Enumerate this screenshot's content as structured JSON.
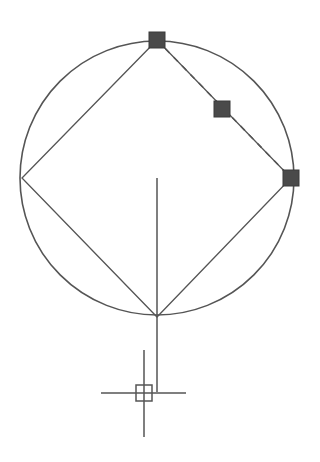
{
  "canvas": {
    "width": 320,
    "height": 462,
    "background": "#ffffff",
    "stroke_color": "#555555",
    "grip_color": "#4a4a4a"
  },
  "circle": {
    "cx": 157,
    "cy": 178,
    "r": 137
  },
  "inscribed_square": {
    "points": [
      [
        157,
        40
      ],
      [
        291,
        178
      ],
      [
        157,
        317
      ],
      [
        22,
        178
      ]
    ]
  },
  "rubber_band_line": {
    "x1": 157,
    "y1": 40,
    "x2": 291,
    "y2": 178,
    "style": "dashed"
  },
  "grips": [
    {
      "name": "grip-top",
      "x": 157,
      "y": 40,
      "size": 16
    },
    {
      "name": "grip-midpoint",
      "x": 222,
      "y": 109,
      "size": 16
    },
    {
      "name": "grip-right",
      "x": 291,
      "y": 178,
      "size": 16
    }
  ],
  "vertical_line": {
    "x1": 157,
    "y1": 178,
    "x2": 157,
    "y2": 392
  },
  "crosshair_cursor": {
    "x": 144,
    "y": 393,
    "h_left": 101,
    "h_right": 186,
    "v_top": 350,
    "v_bottom": 437,
    "pickbox": 16
  }
}
